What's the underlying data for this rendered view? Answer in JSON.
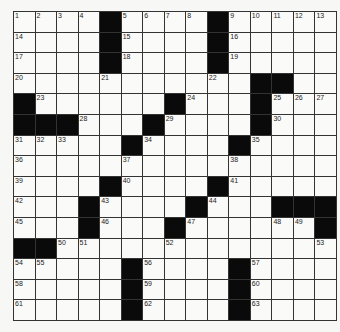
{
  "puzzle": {
    "rows": 15,
    "cols": 15,
    "grid": [
      "....#....#.....",
      "....#....#.....",
      "....#....#.....",
      "...........##..",
      "#......#...#...",
      "###...#....#...",
      ".....#....#....",
      "...............",
      "....#....#.....",
      "...#....#...###",
      "...#...#......#",
      "##.............",
      ".....#....#....",
      ".....#....#....",
      ".....#....#...."
    ],
    "numbers": [
      [
        0,
        0,
        1
      ],
      [
        0,
        1,
        2
      ],
      [
        0,
        2,
        3
      ],
      [
        0,
        3,
        4
      ],
      [
        0,
        5,
        5
      ],
      [
        0,
        6,
        6
      ],
      [
        0,
        7,
        7
      ],
      [
        0,
        8,
        8
      ],
      [
        0,
        10,
        9
      ],
      [
        0,
        11,
        10
      ],
      [
        0,
        12,
        11
      ],
      [
        0,
        13,
        12
      ],
      [
        0,
        14,
        13
      ],
      [
        1,
        0,
        14
      ],
      [
        1,
        5,
        15
      ],
      [
        1,
        10,
        16
      ],
      [
        2,
        0,
        17
      ],
      [
        2,
        5,
        18
      ],
      [
        2,
        10,
        19
      ],
      [
        3,
        0,
        20
      ],
      [
        3,
        4,
        21
      ],
      [
        3,
        9,
        22
      ],
      [
        4,
        1,
        23
      ],
      [
        4,
        8,
        24
      ],
      [
        4,
        12,
        25
      ],
      [
        4,
        13,
        26
      ],
      [
        4,
        14,
        27
      ],
      [
        5,
        3,
        28
      ],
      [
        5,
        7,
        29
      ],
      [
        5,
        12,
        30
      ],
      [
        6,
        0,
        31
      ],
      [
        6,
        1,
        32
      ],
      [
        6,
        2,
        33
      ],
      [
        6,
        6,
        34
      ],
      [
        6,
        11,
        35
      ],
      [
        7,
        0,
        36
      ],
      [
        7,
        5,
        37
      ],
      [
        7,
        10,
        38
      ],
      [
        8,
        0,
        39
      ],
      [
        8,
        5,
        40
      ],
      [
        8,
        10,
        41
      ],
      [
        9,
        0,
        42
      ],
      [
        9,
        4,
        43
      ],
      [
        9,
        9,
        44
      ],
      [
        10,
        0,
        45
      ],
      [
        10,
        4,
        46
      ],
      [
        10,
        8,
        47
      ],
      [
        10,
        12,
        48
      ],
      [
        10,
        13,
        49
      ],
      [
        11,
        2,
        50
      ],
      [
        11,
        3,
        51
      ],
      [
        11,
        7,
        52
      ],
      [
        11,
        14,
        53
      ],
      [
        12,
        0,
        54
      ],
      [
        12,
        1,
        55
      ],
      [
        12,
        6,
        56
      ],
      [
        12,
        11,
        57
      ],
      [
        13,
        0,
        58
      ],
      [
        13,
        6,
        59
      ],
      [
        13,
        11,
        60
      ],
      [
        14,
        0,
        61
      ],
      [
        14,
        6,
        62
      ],
      [
        14,
        11,
        63
      ]
    ]
  }
}
